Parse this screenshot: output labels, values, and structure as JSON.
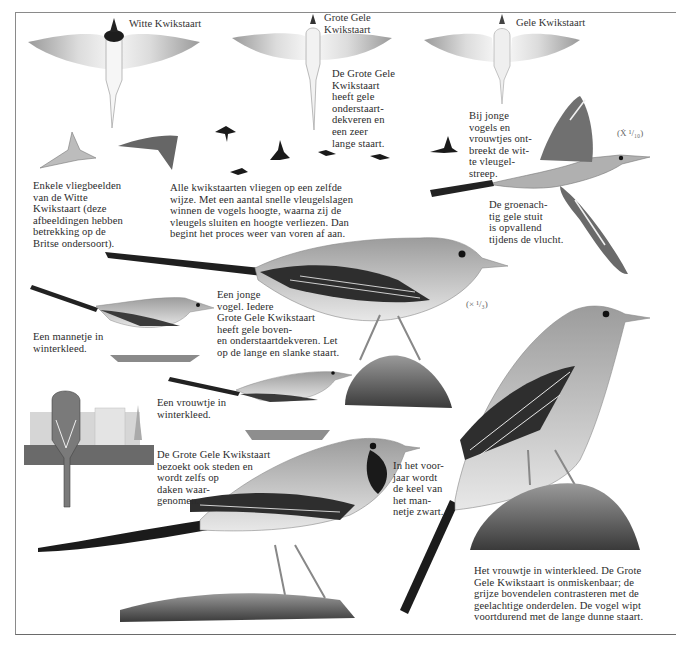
{
  "plate": {
    "flight_labels": {
      "witte": "Witte Kwikstaart",
      "grote_gele": "Grote Gele\nKwikstaart",
      "gele": "Gele Kwikstaart"
    },
    "captions": {
      "grote_gele_tail": "De Grote Gele\nKwikstaart\nheeft gele\nonderstaart-\ndekveren en\neen zeer\nlange staart.",
      "jonge_vogels": "Bij jonge\nvogels en\nvrouwtjes ont-\nbreekt de wit-\nte vleugel-\nstreep.",
      "vliegbeelden": "Enkele vliegbeelden\nvan de Witte\nKwikstaart (deze\nafbeeldingen hebben\nbetrekking op de\nBritse ondersoort).",
      "vliegen": "Alle kwikstaarten vliegen op een zelfde\nwijze. Met een aantal snelle vleugelslagen\nwinnen de vogels hoogte, waarna zij de\nvleugels sluiten en hoogte verliezen. Dan\nbegint het proces weer van voren af aan.",
      "stuit": "De groenach-\ntig gele stuit\nis opvallend\ntijdens de vlucht.",
      "mannetje_winter": "Een mannetje in\nwinterkleed.",
      "jonge_vogel": "Een jonge\nvogel. Iedere\nGrote Gele Kwikstaart\nheeft gele boven-\nen onderstaartdekveren. Let\nop de lange en slanke staart.",
      "vrouwtje_winter": "Een vrouwtje in\nwinterkleed.",
      "steden": "De Grote Gele Kwikstaart\nbezoekt ook steden en\nwordt zelfs op\ndaken waar-\ngenomen.",
      "voorjaar": "In het voor-\njaar wordt\nde keel van\nhet man-\nnetje zwart.",
      "vrouwtje_onmiskenbaar": "Het vrouwtje in winterkleed. De Grote\nGele Kwikstaart is onmiskenbaar; de\ngrijze bovendelen contrasteren met de\ngeelachtige onderdelen. De vogel wipt\nvoortdurend met de lange dunne staart."
    },
    "scales": {
      "flight": "(Ẋ ¹/₁₀)",
      "standing": "(× ¹/₃)"
    },
    "colors": {
      "ink": "#2b2b2b",
      "frame": "#8a8a8a",
      "wing_dark": "#3a3a3a",
      "body_grey": "#b8b8b8"
    }
  }
}
